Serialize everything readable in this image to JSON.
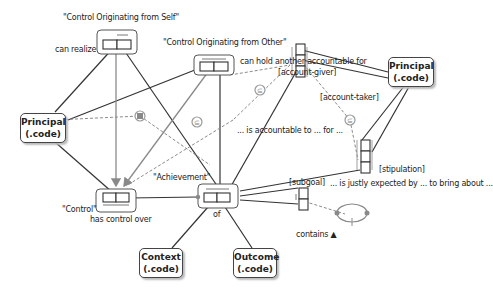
{
  "diagram": {
    "nodes": {
      "principal_left": {
        "line1": "Principal",
        "line2": "(.code)"
      },
      "principal_right": {
        "line1": "Principal",
        "line2": "(.code)"
      },
      "context": {
        "line1": "Context",
        "line2": "(.code)"
      },
      "outcome": {
        "line1": "Outcome",
        "line2": "(.code)"
      }
    },
    "facts": {
      "control_self": {
        "title": "\"Control Originating from Self\"",
        "reading": "can realize"
      },
      "control_other": {
        "title": "\"Control Originating from Other\"",
        "reading": "can hold another accountable for"
      },
      "control": {
        "title": "\"Control\"",
        "reading": "has control over"
      },
      "achievement": {
        "title": "\"Achievement\"",
        "reading": "of"
      },
      "accountable": {
        "role1": "[account-giver]",
        "role2": "[account-taker]",
        "reading": "... is accountable to ... for ..."
      },
      "expected": {
        "role": "[stipulation]",
        "reading": "... is justly expected by ... to bring about ..."
      },
      "contains": {
        "role": "[subgoal]",
        "reading": "contains ▲"
      }
    },
    "constraint_symbols": {
      "subset": "⊆",
      "exclusion": "▣"
    },
    "colors": {
      "line": "#333333",
      "gray_line": "#8a8a8a",
      "dashed": "#8a8a8a",
      "constraint": "#9a9a9a"
    }
  }
}
